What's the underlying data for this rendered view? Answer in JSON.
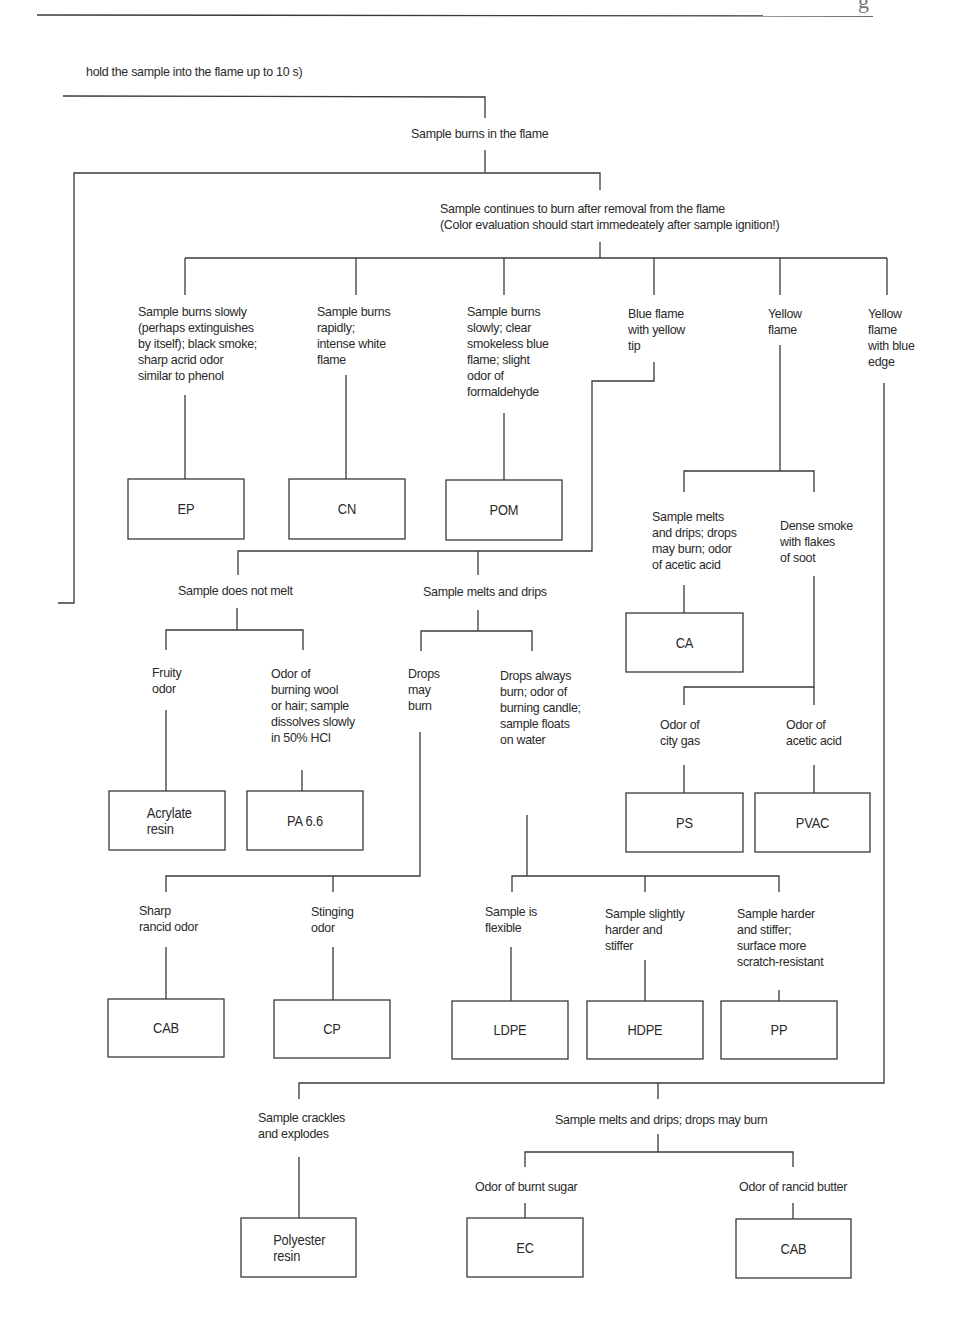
{
  "header": {
    "corner_fragment": "g",
    "intro": "hold the sample into the flame up to 10 s)"
  },
  "level1": {
    "burns_in_flame": "Sample burns in the flame"
  },
  "level2": {
    "continues_line1": "Sample continues to burn after removal from the flame",
    "continues_line2": "(Color evaluation should start immedeately after sample ignition!)"
  },
  "branches": [
    {
      "id": "ep_branch",
      "text": "Sample burns slowly\n(perhaps extinguishes\nby itself); black smoke;\nsharp acrid odor\nsimilar to phenol",
      "result": "EP"
    },
    {
      "id": "cn_branch",
      "text": "Sample burns\nrapidly;\nintense white\nflame",
      "result": "CN"
    },
    {
      "id": "pom_branch",
      "text": "Sample burns\nslowly; clear\nsmokeless blue\nflame; slight\nodor of\nformaldehyde",
      "result": "POM"
    },
    {
      "id": "blue_yellow_tip",
      "text": "Blue flame\nwith yellow\ntip"
    },
    {
      "id": "yellow_flame",
      "text": "Yellow\nflame"
    },
    {
      "id": "yellow_blue_edge",
      "text": "Yellow\nflame\nwith blue\nedge"
    }
  ],
  "blue_flame_sub": {
    "does_not_melt": "Sample does not melt",
    "melts_drips": "Sample melts and drips",
    "fruity": "Fruity\nodor",
    "wool": "Odor of\nburning wool\nor hair; sample\ndissolves slowly\nin 50% HCl",
    "drops_may_burn": "Drops\nmay\nburn",
    "drops_always": "Drops always\nburn; odor of\nburning candle;\nsample floats\non water",
    "acrylate": "Acrylate\nresin",
    "pa66": "PA 6.6",
    "sharp_rancid": "Sharp\nrancid odor",
    "stinging": "Stinging\nodor",
    "flexible": "Sample is\nflexible",
    "slightly_harder": "Sample slightly\nharder and\nstiffer",
    "harder": "Sample harder\nand stiffer;\nsurface more\nscratch-resistant",
    "cab": "CAB",
    "cp": "CP",
    "ldpe": "LDPE",
    "hdpe": "HDPE",
    "pp": "PP"
  },
  "yellow_sub": {
    "melts_acetic": "Sample melts\nand drips; drops\nmay burn; odor\nof acetic acid",
    "dense_smoke": "Dense smoke\nwith flakes\nof soot",
    "ca": "CA",
    "city_gas": "Odor of\ncity gas",
    "acetic": "Odor of\nacetic acid",
    "ps": "PS",
    "pvac": "PVAC"
  },
  "blue_edge_sub": {
    "crackles": "Sample crackles\nand explodes",
    "melts_may_burn": "Sample melts and drips; drops may burn",
    "burnt_sugar": "Odor of burnt sugar",
    "rancid_butter": "Odor of rancid butter",
    "polyester": "Polyester\nresin",
    "ec": "EC",
    "cab2": "CAB"
  }
}
